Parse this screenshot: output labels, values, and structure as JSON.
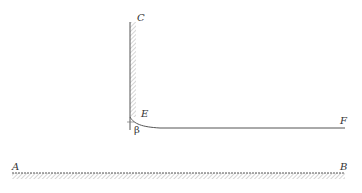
{
  "diagram": {
    "labels": {
      "wall_top": "C",
      "meniscus_point": "E",
      "surface_end": "F",
      "ground_left": "A",
      "ground_right": "B",
      "contact_angle": "β"
    },
    "colors": {
      "line": "#555555",
      "hatch": "#999999",
      "text": "#333333"
    }
  }
}
